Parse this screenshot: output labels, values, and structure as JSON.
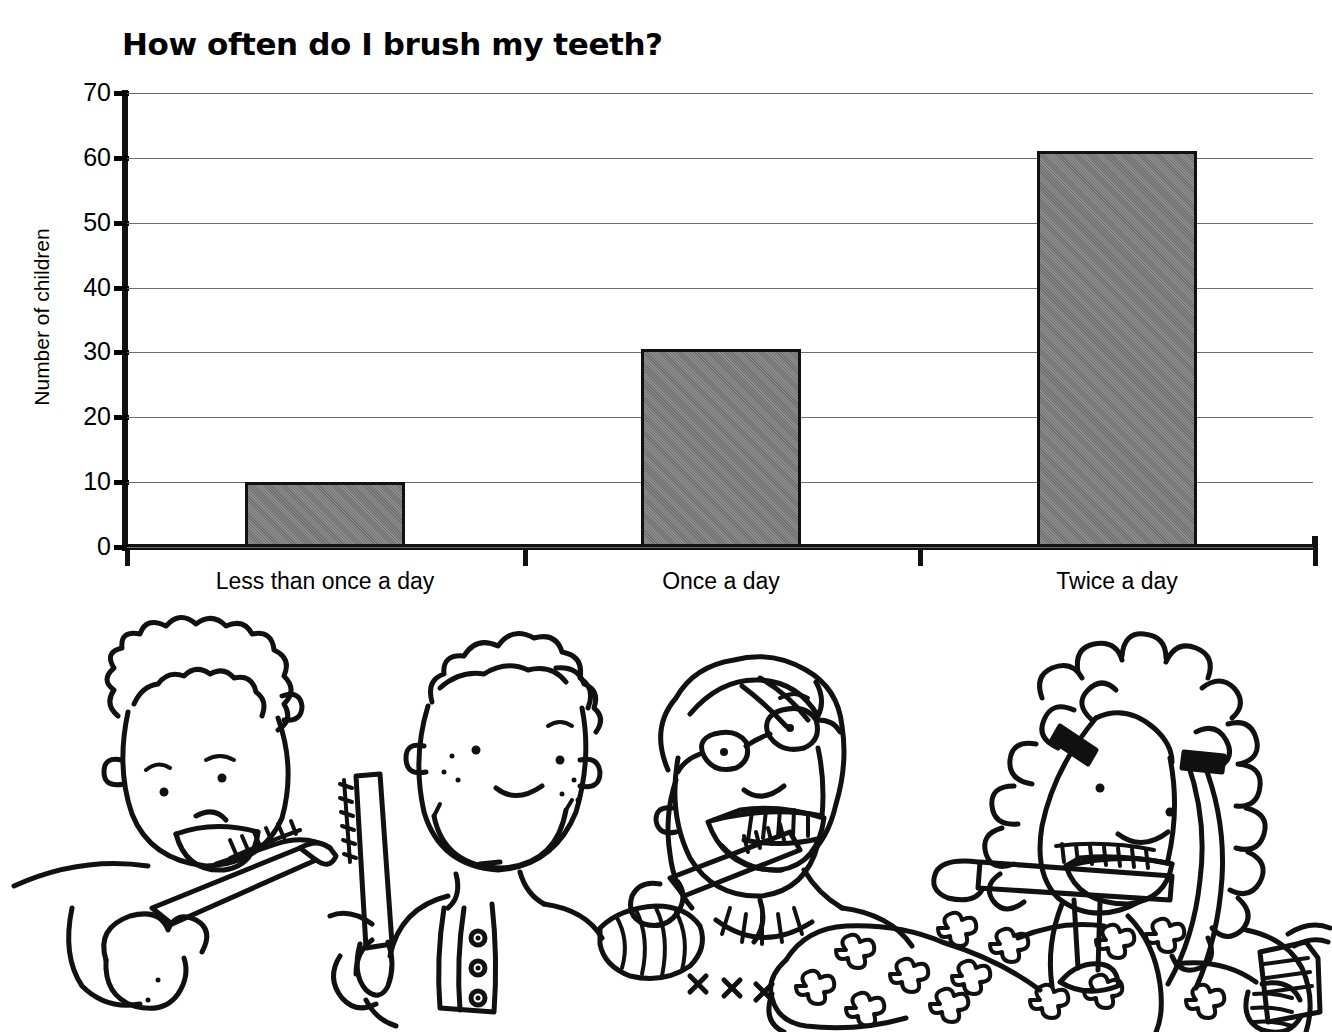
{
  "chart_data": {
    "type": "bar",
    "title": "How often do I brush my teeth?",
    "xlabel": "",
    "ylabel": "Number of children",
    "categories": [
      "Less than once a day",
      "Once a day",
      "Twice a day"
    ],
    "values": [
      10,
      30.5,
      61
    ],
    "ylim": [
      0,
      70
    ],
    "yticks": [
      "0",
      "10",
      "20",
      "30",
      "40",
      "50",
      "60",
      "70"
    ],
    "ytick_values": [
      0,
      10,
      20,
      30,
      40,
      50,
      60,
      70
    ],
    "grid": true,
    "legend": "none",
    "bar_fill_color": "#7d7d7d",
    "bar_edge_color": "#111111",
    "gridline_color": "#6d6d6d",
    "axis_color": "#111111",
    "background_color": "#ffffff"
  },
  "illustration": {
    "caption": "Line drawing of four children brushing their teeth",
    "figures": [
      {
        "name": "curly-haired-child-with-toothbrush",
        "description": "Child with curly hair smiling and holding a toothbrush"
      },
      {
        "name": "freckled-boy-with-toothbrush",
        "description": "Smiling boy with freckles, buttoned shirt, holding a toothbrush upright"
      },
      {
        "name": "girl-with-glasses-brushing",
        "description": "Girl wearing glasses brushing her teeth, floral sleeve"
      },
      {
        "name": "curly-haired-girl-with-toothpaste",
        "description": "Girl with long curly hair brushing teeth and holding a toothpaste tube"
      }
    ]
  }
}
